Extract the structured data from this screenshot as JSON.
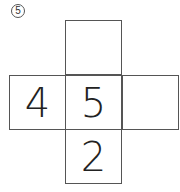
{
  "problem": {
    "number_label": "⑤"
  },
  "net": {
    "top": "",
    "left": "4",
    "center": "5",
    "right": "",
    "bottom": "2"
  }
}
